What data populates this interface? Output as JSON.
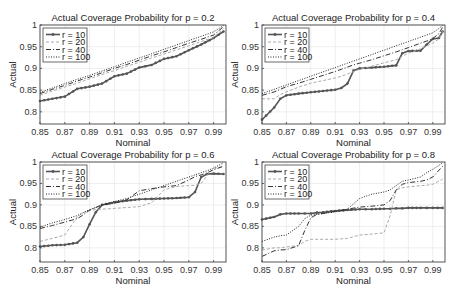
{
  "figure": {
    "rows": 2,
    "cols": 2
  },
  "chart_data": [
    {
      "type": "line",
      "title": "Actual Coverage Probability for p = 0.2",
      "xlabel": "Nominal",
      "ylabel": "Actual",
      "xlim": [
        0.85,
        1.0
      ],
      "ylim": [
        0.772,
        1.0
      ],
      "xticks": [
        "0.85",
        "0.87",
        "0.89",
        "0.91",
        "0.93",
        "0.95",
        "0.97",
        "0.99"
      ],
      "yticks": [
        "0.8",
        "0.85",
        "0.9",
        "0.95",
        "1"
      ],
      "grid": true,
      "legend_position": "upper left",
      "x": [
        0.85,
        0.86,
        0.87,
        0.88,
        0.89,
        0.9,
        0.91,
        0.92,
        0.93,
        0.94,
        0.95,
        0.96,
        0.97,
        0.98,
        0.99,
        0.998
      ],
      "series": [
        {
          "name": "r = 10",
          "style": "solid-marker",
          "values": [
            0.825,
            0.83,
            0.835,
            0.853,
            0.858,
            0.865,
            0.882,
            0.888,
            0.902,
            0.908,
            0.922,
            0.928,
            0.942,
            0.955,
            0.97,
            0.985
          ]
        },
        {
          "name": "r = 20",
          "style": "dashed-light",
          "values": [
            0.838,
            0.848,
            0.857,
            0.866,
            0.876,
            0.886,
            0.895,
            0.905,
            0.914,
            0.924,
            0.933,
            0.943,
            0.952,
            0.962,
            0.971,
            0.992
          ]
        },
        {
          "name": "r = 40",
          "style": "dashdot",
          "values": [
            0.842,
            0.852,
            0.861,
            0.871,
            0.88,
            0.89,
            0.9,
            0.909,
            0.919,
            0.929,
            0.938,
            0.948,
            0.958,
            0.967,
            0.977,
            0.996
          ]
        },
        {
          "name": "r = 100",
          "style": "dotted",
          "values": [
            0.845,
            0.855,
            0.865,
            0.875,
            0.884,
            0.894,
            0.904,
            0.914,
            0.924,
            0.934,
            0.944,
            0.954,
            0.964,
            0.974,
            0.984,
            0.999
          ]
        }
      ]
    },
    {
      "type": "line",
      "title": "Actual Coverage Probability for p = 0.4",
      "xlabel": "Nominal",
      "ylabel": "Actual",
      "xlim": [
        0.85,
        1.0
      ],
      "ylim": [
        0.772,
        1.0
      ],
      "xticks": [
        "0.85",
        "0.87",
        "0.89",
        "0.91",
        "0.93",
        "0.95",
        "0.97",
        "0.99"
      ],
      "yticks": [
        "0.8",
        "0.85",
        "0.9",
        "0.95",
        "1"
      ],
      "grid": true,
      "legend_position": "upper left",
      "x": [
        0.85,
        0.86,
        0.865,
        0.87,
        0.88,
        0.89,
        0.9,
        0.91,
        0.915,
        0.92,
        0.925,
        0.93,
        0.94,
        0.95,
        0.96,
        0.965,
        0.97,
        0.98,
        0.985,
        0.99,
        0.995,
        0.998
      ],
      "series": [
        {
          "name": "r = 10",
          "style": "solid-marker",
          "values": [
            0.782,
            0.81,
            0.83,
            0.838,
            0.842,
            0.845,
            0.848,
            0.851,
            0.855,
            0.865,
            0.895,
            0.9,
            0.902,
            0.904,
            0.907,
            0.935,
            0.94,
            0.941,
            0.955,
            0.968,
            0.97,
            0.985
          ]
        },
        {
          "name": "r = 20",
          "style": "dashed-light",
          "values": [
            0.83,
            0.83,
            0.84,
            0.846,
            0.857,
            0.866,
            0.872,
            0.878,
            0.882,
            0.887,
            0.893,
            0.898,
            0.905,
            0.913,
            0.92,
            0.928,
            0.935,
            0.945,
            0.952,
            0.958,
            0.968,
            0.985
          ]
        },
        {
          "name": "r = 40",
          "style": "dashdot",
          "values": [
            0.838,
            0.846,
            0.852,
            0.858,
            0.866,
            0.875,
            0.884,
            0.893,
            0.898,
            0.903,
            0.908,
            0.912,
            0.92,
            0.929,
            0.938,
            0.943,
            0.948,
            0.958,
            0.963,
            0.969,
            0.98,
            0.995
          ]
        },
        {
          "name": "r = 100",
          "style": "dotted",
          "values": [
            0.842,
            0.852,
            0.857,
            0.862,
            0.872,
            0.882,
            0.892,
            0.902,
            0.907,
            0.912,
            0.917,
            0.922,
            0.932,
            0.942,
            0.952,
            0.957,
            0.962,
            0.972,
            0.977,
            0.982,
            0.992,
            0.999
          ]
        }
      ]
    },
    {
      "type": "line",
      "title": "Actual Coverage Probability for p = 0.6",
      "xlabel": "Nominal",
      "ylabel": "Actual",
      "xlim": [
        0.85,
        1.0
      ],
      "ylim": [
        0.767,
        1.0
      ],
      "xticks": [
        "0.85",
        "0.87",
        "0.89",
        "0.91",
        "0.93",
        "0.95",
        "0.97",
        "0.99"
      ],
      "yticks": [
        "0.8",
        "0.85",
        "0.9",
        "0.95",
        "1"
      ],
      "grid": true,
      "legend_position": "upper left",
      "x": [
        0.85,
        0.86,
        0.87,
        0.88,
        0.885,
        0.89,
        0.895,
        0.9,
        0.91,
        0.92,
        0.93,
        0.94,
        0.95,
        0.96,
        0.97,
        0.975,
        0.98,
        0.985,
        0.99,
        0.998
      ],
      "series": [
        {
          "name": "r = 10",
          "style": "solid-marker",
          "values": [
            0.803,
            0.806,
            0.807,
            0.812,
            0.825,
            0.855,
            0.883,
            0.9,
            0.906,
            0.91,
            0.913,
            0.914,
            0.915,
            0.916,
            0.918,
            0.93,
            0.965,
            0.972,
            0.973,
            0.972
          ]
        },
        {
          "name": "r = 20",
          "style": "dashed-light",
          "values": [
            0.815,
            0.822,
            0.83,
            0.872,
            0.882,
            0.887,
            0.889,
            0.89,
            0.892,
            0.894,
            0.896,
            0.905,
            0.935,
            0.943,
            0.945,
            0.946,
            0.95,
            0.97,
            0.985,
            0.99
          ]
        },
        {
          "name": "r = 40",
          "style": "dashdot",
          "values": [
            0.845,
            0.852,
            0.86,
            0.868,
            0.877,
            0.888,
            0.894,
            0.9,
            0.904,
            0.912,
            0.933,
            0.938,
            0.942,
            0.945,
            0.958,
            0.966,
            0.97,
            0.975,
            0.982,
            0.99
          ]
        },
        {
          "name": "r = 100",
          "style": "dotted",
          "values": [
            0.848,
            0.858,
            0.866,
            0.875,
            0.882,
            0.889,
            0.894,
            0.9,
            0.908,
            0.915,
            0.925,
            0.935,
            0.945,
            0.955,
            0.965,
            0.97,
            0.975,
            0.98,
            0.986,
            0.998
          ]
        }
      ]
    },
    {
      "type": "line",
      "title": "Actual Coverage Probability for p = 0.8",
      "xlabel": "Nominal",
      "ylabel": "Actual",
      "xlim": [
        0.85,
        1.0
      ],
      "ylim": [
        0.767,
        1.0
      ],
      "xticks": [
        "0.85",
        "0.87",
        "0.89",
        "0.91",
        "0.93",
        "0.95",
        "0.97",
        "0.99"
      ],
      "yticks": [
        "0.8",
        "0.85",
        "0.9",
        "0.95",
        "1"
      ],
      "grid": true,
      "legend_position": "upper left",
      "x": [
        0.85,
        0.86,
        0.865,
        0.87,
        0.88,
        0.885,
        0.89,
        0.895,
        0.9,
        0.91,
        0.92,
        0.93,
        0.94,
        0.95,
        0.955,
        0.96,
        0.965,
        0.97,
        0.98,
        0.985,
        0.99,
        0.998
      ],
      "series": [
        {
          "name": "r = 10",
          "style": "solid-marker",
          "values": [
            0.866,
            0.872,
            0.878,
            0.88,
            0.88,
            0.88,
            0.88,
            0.882,
            0.883,
            0.886,
            0.888,
            0.89,
            0.89,
            0.891,
            0.891,
            0.892,
            0.892,
            0.893,
            0.893,
            0.893,
            0.893,
            0.893
          ]
        },
        {
          "name": "r = 20",
          "style": "dashed-light",
          "values": [
            0.795,
            0.8,
            0.8,
            0.802,
            0.806,
            0.815,
            0.82,
            0.82,
            0.82,
            0.82,
            0.822,
            0.83,
            0.832,
            0.835,
            0.875,
            0.935,
            0.94,
            0.942,
            0.945,
            0.946,
            0.948,
            0.96
          ]
        },
        {
          "name": "r = 40",
          "style": "dashdot",
          "values": [
            0.78,
            0.793,
            0.795,
            0.796,
            0.805,
            0.84,
            0.87,
            0.878,
            0.88,
            0.885,
            0.89,
            0.895,
            0.897,
            0.9,
            0.91,
            0.935,
            0.948,
            0.952,
            0.955,
            0.958,
            0.965,
            0.99
          ]
        },
        {
          "name": "r = 100",
          "style": "dotted",
          "values": [
            0.815,
            0.825,
            0.828,
            0.83,
            0.85,
            0.868,
            0.876,
            0.878,
            0.88,
            0.884,
            0.89,
            0.915,
            0.925,
            0.93,
            0.935,
            0.945,
            0.955,
            0.958,
            0.965,
            0.975,
            0.983,
            0.998
          ]
        }
      ]
    }
  ]
}
